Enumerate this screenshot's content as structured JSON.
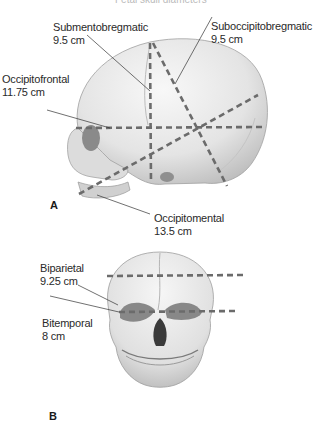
{
  "header": {
    "clipped_caption": "Fetal skull diameters"
  },
  "panel_a": {
    "letter": "A",
    "view": "lateral view of fetal skull",
    "measurements": [
      {
        "name": "Submentobregmatic",
        "value": "9.5 cm"
      },
      {
        "name": "Suboccipitobregmatic",
        "value": "9.5 cm"
      },
      {
        "name": "Occipitofrontal",
        "value": "11.75 cm"
      },
      {
        "name": "Occipitomental",
        "value": "13.5 cm"
      }
    ]
  },
  "panel_b": {
    "letter": "B",
    "view": "frontal view of fetal skull",
    "measurements": [
      {
        "name": "Biparietal",
        "value": "9.25 cm"
      },
      {
        "name": "Bitemporal",
        "value": "8 cm"
      }
    ]
  },
  "colors": {
    "dash": "#6b6b6b",
    "bone_light": "#f2f2f2",
    "bone_mid": "#d6d6d6",
    "bone_dark": "#9a9a9a",
    "leader": "#333333"
  }
}
